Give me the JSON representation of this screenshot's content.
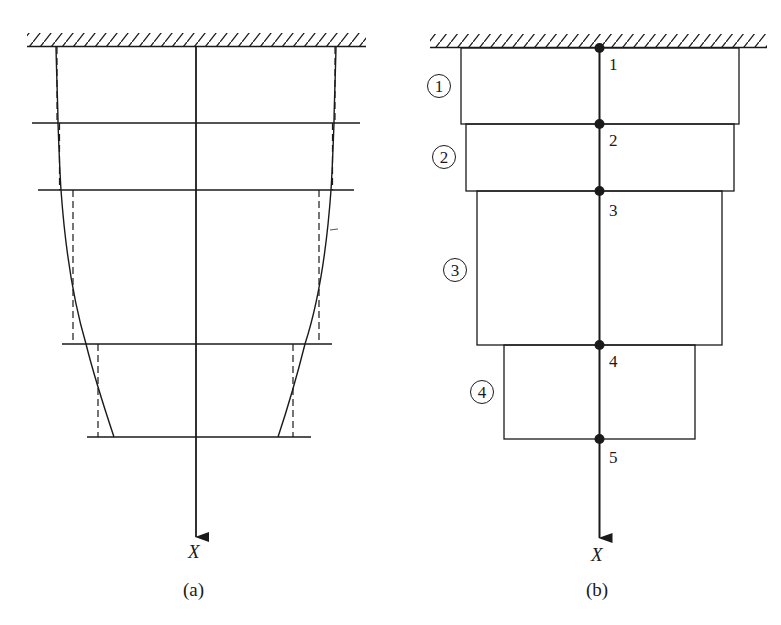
{
  "figure": {
    "panel_a": {
      "caption": "(a)",
      "axis_label": "X",
      "description": "Tapered bar fixed at top, with curved (varying) cross-section boundary and stepped dashed approximation across 4 segments"
    },
    "panel_b": {
      "caption": "(b)",
      "axis_label": "X",
      "elements": [
        {
          "id": "1",
          "label": "1"
        },
        {
          "id": "2",
          "label": "2"
        },
        {
          "id": "3",
          "label": "3"
        },
        {
          "id": "4",
          "label": "4"
        }
      ],
      "nodes": [
        {
          "id": "1",
          "label": "1"
        },
        {
          "id": "2",
          "label": "2"
        },
        {
          "id": "3",
          "label": "3"
        },
        {
          "id": "4",
          "label": "4"
        },
        {
          "id": "5",
          "label": "5"
        }
      ]
    }
  },
  "colors": {
    "ink": "#1a1a1a",
    "background": "#ffffff"
  }
}
